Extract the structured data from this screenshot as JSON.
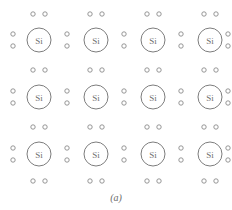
{
  "figure": {
    "caption": "(a)",
    "atom_label": "Si",
    "colors": {
      "background": "#ffffff",
      "atom_stroke": "#7d7d7d",
      "atom_fill": "#ffffff",
      "atom_text": "#6f6f6f",
      "electron_stroke": "#8a8a8a",
      "electron_fill": "#ffffff",
      "caption_text": "#6a6a6a"
    },
    "grid": {
      "columns": 4,
      "rows": 3,
      "atom_radius": 12,
      "electron_radius": 2.2,
      "column_centers_x": [
        39,
        96,
        153,
        210
      ],
      "row_centers_y": [
        40,
        97,
        154
      ]
    },
    "atoms": [
      {
        "label": "Si",
        "cx": 39,
        "cy": 40,
        "row": 0,
        "col": 0
      },
      {
        "label": "Si",
        "cx": 96,
        "cy": 40,
        "row": 0,
        "col": 1
      },
      {
        "label": "Si",
        "cx": 153,
        "cy": 40,
        "row": 0,
        "col": 2
      },
      {
        "label": "Si",
        "cx": 210,
        "cy": 40,
        "row": 0,
        "col": 3
      },
      {
        "label": "Si",
        "cx": 39,
        "cy": 97,
        "row": 1,
        "col": 0
      },
      {
        "label": "Si",
        "cx": 96,
        "cy": 97,
        "row": 1,
        "col": 1
      },
      {
        "label": "Si",
        "cx": 153,
        "cy": 97,
        "row": 1,
        "col": 2
      },
      {
        "label": "Si",
        "cx": 210,
        "cy": 97,
        "row": 1,
        "col": 3
      },
      {
        "label": "Si",
        "cx": 39,
        "cy": 154,
        "row": 2,
        "col": 0
      },
      {
        "label": "Si",
        "cx": 96,
        "cy": 154,
        "row": 2,
        "col": 1
      },
      {
        "label": "Si",
        "cx": 153,
        "cy": 154,
        "row": 2,
        "col": 2
      },
      {
        "label": "Si",
        "cx": 210,
        "cy": 154,
        "row": 2,
        "col": 3
      }
    ],
    "electron_pairs_vertical": [
      {
        "cx": 13,
        "cy": 40
      },
      {
        "cx": 67,
        "cy": 40
      },
      {
        "cx": 124,
        "cy": 40
      },
      {
        "cx": 181,
        "cy": 40
      },
      {
        "cx": 228,
        "cy": 40
      },
      {
        "cx": 13,
        "cy": 97
      },
      {
        "cx": 67,
        "cy": 97
      },
      {
        "cx": 124,
        "cy": 97
      },
      {
        "cx": 181,
        "cy": 97
      },
      {
        "cx": 228,
        "cy": 97
      },
      {
        "cx": 13,
        "cy": 154
      },
      {
        "cx": 67,
        "cy": 154
      },
      {
        "cx": 124,
        "cy": 154
      },
      {
        "cx": 181,
        "cy": 154
      },
      {
        "cx": 228,
        "cy": 154
      }
    ],
    "electron_pairs_horizontal": [
      {
        "cx": 39,
        "cy": 14
      },
      {
        "cx": 96,
        "cy": 14
      },
      {
        "cx": 153,
        "cy": 14
      },
      {
        "cx": 210,
        "cy": 14
      },
      {
        "cx": 39,
        "cy": 70
      },
      {
        "cx": 96,
        "cy": 70
      },
      {
        "cx": 153,
        "cy": 70
      },
      {
        "cx": 210,
        "cy": 70
      },
      {
        "cx": 39,
        "cy": 127
      },
      {
        "cx": 96,
        "cy": 127
      },
      {
        "cx": 153,
        "cy": 127
      },
      {
        "cx": 210,
        "cy": 127
      },
      {
        "cx": 39,
        "cy": 181
      },
      {
        "cx": 96,
        "cy": 181
      },
      {
        "cx": 153,
        "cy": 181
      },
      {
        "cx": 210,
        "cy": 181
      }
    ],
    "caption_position": {
      "cx": 116,
      "cy": 197
    },
    "pair_offset": 6
  }
}
